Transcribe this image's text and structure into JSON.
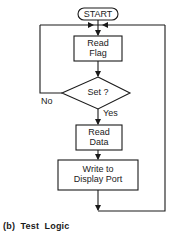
{
  "diagram": {
    "start": "START",
    "nodes": [
      {
        "id": "read-flag",
        "line1": "Read",
        "line2": "Flag"
      },
      {
        "id": "decision",
        "label": "Set ?"
      },
      {
        "id": "read-data",
        "line1": "Read",
        "line2": "Data"
      },
      {
        "id": "write-port",
        "line1": "Write to",
        "line2": "Display Port"
      }
    ],
    "edges": {
      "no": "No",
      "yes": "Yes"
    },
    "caption": "(b)  Test  Logic"
  }
}
